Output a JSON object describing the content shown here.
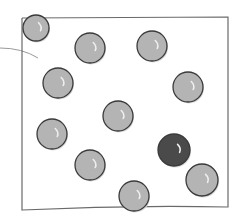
{
  "diagram": {
    "type": "sketch-illustration",
    "colors": {
      "box_stroke": "#6a6a6a",
      "ball_fill": "#b4b4b4",
      "ball_stroke": "#3a3a3a",
      "dark_ball_fill": "#4a4a4a",
      "highlight": "#eeeeee",
      "curve_stroke": "#9a9a9a"
    },
    "box": {
      "x1": 22,
      "y1": 18,
      "x2": 228,
      "y2": 207
    },
    "curve": {
      "from": [
        0,
        48
      ],
      "ctrl": [
        22,
        48
      ],
      "to": [
        38,
        58
      ]
    },
    "balls": [
      {
        "cx": 36,
        "cy": 28,
        "r": 13,
        "dark": false
      },
      {
        "cx": 90,
        "cy": 48,
        "r": 15,
        "dark": false
      },
      {
        "cx": 152,
        "cy": 46,
        "r": 15,
        "dark": false
      },
      {
        "cx": 58,
        "cy": 83,
        "r": 15,
        "dark": false
      },
      {
        "cx": 188,
        "cy": 87,
        "r": 15,
        "dark": false
      },
      {
        "cx": 118,
        "cy": 116,
        "r": 15,
        "dark": false
      },
      {
        "cx": 52,
        "cy": 134,
        "r": 15,
        "dark": false
      },
      {
        "cx": 174,
        "cy": 150,
        "r": 16,
        "dark": true
      },
      {
        "cx": 90,
        "cy": 165,
        "r": 15,
        "dark": false
      },
      {
        "cx": 202,
        "cy": 180,
        "r": 16,
        "dark": false
      },
      {
        "cx": 134,
        "cy": 196,
        "r": 15,
        "dark": false
      }
    ]
  }
}
